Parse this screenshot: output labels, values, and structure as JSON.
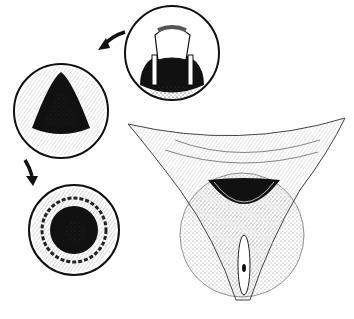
{
  "illustration": {
    "subject": "anatomical line drawing",
    "style": "black ink hatching on white",
    "panels": [
      {
        "name": "top-right-circle-detail",
        "shape": "circle"
      },
      {
        "name": "middle-left-circle-triangular-opening",
        "shape": "circle"
      },
      {
        "name": "bottom-left-circle-round-opening",
        "shape": "circle"
      },
      {
        "name": "main-cross-section-view",
        "shape": "v-shaped"
      }
    ],
    "arrows": [
      {
        "name": "arrow-top",
        "direction": "left-down"
      },
      {
        "name": "arrow-bottom",
        "direction": "down"
      }
    ],
    "colors": {
      "ink": "#111111",
      "paper": "#ffffff"
    }
  }
}
